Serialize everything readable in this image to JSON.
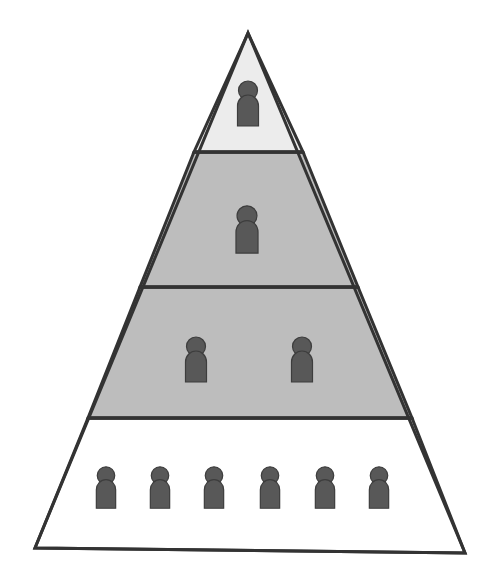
{
  "figure": {
    "type": "pyramid-diagram",
    "background_color": "#ffffff",
    "canvas": {
      "width": 493,
      "height": 581
    }
  },
  "chart_data": {
    "type": "pyramid",
    "subtitle": "",
    "xlabel": "",
    "ylabel": "",
    "legend": [],
    "grid": false,
    "categories": [
      "Tier 1 (apex)",
      "Tier 2",
      "Tier 3",
      "Tier 4 (base)"
    ],
    "values": [
      1,
      1,
      2,
      6
    ],
    "value_label": "people per tier",
    "total_people": 10,
    "series": [
      {
        "name": "People per tier",
        "values": [
          1,
          1,
          2,
          6
        ]
      }
    ],
    "tier_fills": [
      "#ececec",
      "#bdbdbd",
      "#bdbdbd",
      "#ffffff"
    ],
    "annotations": []
  },
  "geometry": {
    "apex": {
      "x": 248,
      "y": 33
    },
    "base_left": {
      "x": 35,
      "y": 548
    },
    "base_right": {
      "x": 465,
      "y": 553
    },
    "divider_y": [
      152,
      287,
      418
    ],
    "outline_color": "#333333",
    "outline_width": 3,
    "divider_width": 3.5
  },
  "person_icon": {
    "name": "person-icon",
    "fill": "#585858",
    "stroke": "#3d3d3d",
    "description": "round head above rounded-top torso"
  },
  "tiers": [
    {
      "id": "tier-1",
      "label": "Tier 1",
      "position": "apex",
      "fill": "#ececec",
      "people_count": 1,
      "people": [
        {
          "cx": 248,
          "cy": 104,
          "scale": 1.0
        }
      ]
    },
    {
      "id": "tier-2",
      "label": "Tier 2",
      "position": "upper-middle",
      "fill": "#bdbdbd",
      "people_count": 1,
      "people": [
        {
          "cx": 247,
          "cy": 230,
          "scale": 1.05
        }
      ]
    },
    {
      "id": "tier-3",
      "label": "Tier 3",
      "position": "lower-middle",
      "fill": "#bdbdbd",
      "people_count": 2,
      "people": [
        {
          "cx": 196,
          "cy": 360,
          "scale": 1.0
        },
        {
          "cx": 302,
          "cy": 360,
          "scale": 1.0
        }
      ]
    },
    {
      "id": "tier-4",
      "label": "Tier 4",
      "position": "base",
      "fill": "#ffffff",
      "people_count": 6,
      "people": [
        {
          "cx": 106,
          "cy": 488,
          "scale": 0.92
        },
        {
          "cx": 160,
          "cy": 488,
          "scale": 0.92
        },
        {
          "cx": 214,
          "cy": 488,
          "scale": 0.92
        },
        {
          "cx": 270,
          "cy": 488,
          "scale": 0.92
        },
        {
          "cx": 325,
          "cy": 488,
          "scale": 0.92
        },
        {
          "cx": 379,
          "cy": 488,
          "scale": 0.92
        }
      ]
    }
  ]
}
